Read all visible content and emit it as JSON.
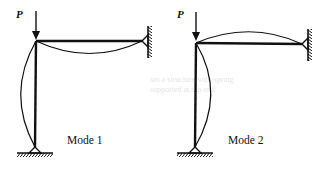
{
  "figure": {
    "panels": [
      {
        "id": "mode1",
        "load_label": "P",
        "caption": "Mode 1",
        "buckled_column": "bows left",
        "buckled_beam": "sags below"
      },
      {
        "id": "mode2",
        "load_label": "P",
        "caption": "Mode 2",
        "buckled_column": "bows right",
        "buckled_beam": "arches above"
      }
    ],
    "colors": {
      "line": "#111111",
      "background": "#ffffff"
    }
  }
}
